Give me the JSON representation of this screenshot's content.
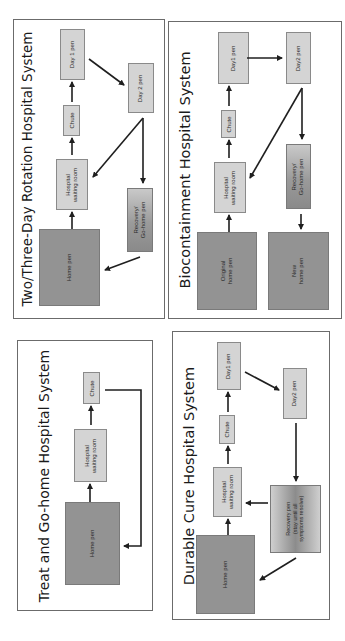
{
  "figure": {
    "orientation": "rotated 90° counter-clockwise",
    "colors": {
      "light_box": "#d4d4d4",
      "dark_box": "#939393",
      "border": "#6b6b6b",
      "arrow": "#1f1f1f"
    },
    "panels": [
      {
        "id": "two-three-day",
        "title": "Two/Three-Day Rotation Hospital System",
        "boxes": {
          "day1": "Day 1 pen",
          "chute": "Chute",
          "waiting": "Hospital\nwaiting room",
          "home": "Home pen",
          "day2": "Day 2 pen",
          "recovery": "Recovery/\nGo-home pen"
        },
        "flows": [
          "Home pen → Hospital waiting room",
          "Hospital waiting room → Chute",
          "Chute → Day 1 pen",
          "Day 1 pen → Day 2 pen",
          "Day 2 pen → Hospital waiting room",
          "Day 2 pen → Recovery/Go-home pen",
          "Recovery/Go-home pen → Home pen"
        ]
      },
      {
        "id": "biocontainment",
        "title": "Biocontainment Hospital System",
        "boxes": {
          "day1": "Day1 pen",
          "chute": "Chute",
          "waiting": "Hospital\nwaiting room",
          "original_home": "Original\nhome pen",
          "day2": "Day2 pen",
          "recovery": "Recovery/\nGo-home pen",
          "new_home": "New\nhome pen"
        },
        "flows": [
          "Original home pen → Hospital waiting room",
          "Hospital waiting room → Chute",
          "Chute → Day1 pen",
          "Day1 pen → Day2 pen",
          "Day2 pen → Hospital waiting room",
          "Day2 pen → Recovery/Go-home pen",
          "Recovery/Go-home pen → New home pen"
        ]
      },
      {
        "id": "treat-go-home",
        "title": "Treat and Go-home Hospital System",
        "boxes": {
          "chute": "Chute",
          "waiting": "Hospital\nwaiting room",
          "home": "Home pen"
        },
        "flows": [
          "Home pen → Hospital waiting room",
          "Hospital waiting room → Chute",
          "Chute → Home pen"
        ]
      },
      {
        "id": "durable-cure",
        "title": "Durable Cure Hospital System",
        "boxes": {
          "day1": "Day1 pen",
          "chute": "Chute",
          "waiting": "Hospital\nwaiting room",
          "home": "Home pen",
          "day2": "Day2 pen",
          "recovery": "Recovery pen\n(stay until all\nsymptoms resolve)"
        },
        "flows": [
          "Home pen → Hospital waiting room",
          "Hospital waiting room → Chute",
          "Chute → Day1 pen",
          "Day1 pen → Day2 pen",
          "Day2 pen → Recovery pen",
          "Recovery pen → Hospital waiting room",
          "Recovery pen → Home pen"
        ]
      }
    ]
  }
}
